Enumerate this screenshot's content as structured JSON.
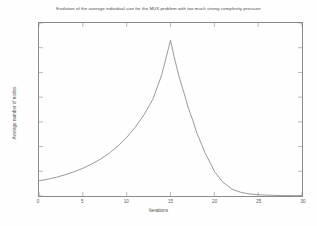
{
  "chart_data": {
    "type": "line",
    "title": "Evolution of the average individual size for the MUX problem with too much strong complexity pressure",
    "xlabel": "Iterations",
    "ylabel": "Average number of nodes",
    "xlim": [
      0,
      30
    ],
    "ylim": [
      0,
      140
    ],
    "xticks": [
      0,
      5,
      10,
      15,
      20,
      25,
      30
    ],
    "yticks": [
      0,
      20,
      40,
      60,
      80,
      100,
      120,
      140
    ],
    "grid": false,
    "legend": null,
    "line_color": "#6e6e6e",
    "series": [
      {
        "name": "average individual size",
        "x": [
          0,
          1,
          2,
          3,
          4,
          5,
          6,
          7,
          8,
          9,
          10,
          11,
          12,
          13,
          14,
          15,
          15.4,
          16,
          16.6,
          17,
          17.6,
          18,
          18.6,
          19,
          19.6,
          20,
          20.6,
          21,
          21.6,
          22,
          22.6,
          23,
          24,
          25,
          26,
          27,
          28,
          29,
          30
        ],
        "y": [
          12.3,
          13.6,
          15.2,
          17.2,
          19.6,
          22.4,
          25.8,
          29.8,
          34.6,
          40.4,
          47.4,
          55.8,
          66.0,
          78.5,
          98.0,
          126.0,
          113.0,
          96.0,
          82.0,
          72.0,
          60.0,
          51.0,
          41.0,
          34.0,
          26.0,
          20.0,
          14.5,
          11.0,
          7.8,
          5.6,
          4.0,
          3.0,
          1.7,
          1.0,
          0.7,
          0.5,
          0.4,
          0.3,
          0.2
        ]
      }
    ],
    "peak": {
      "x": 15,
      "y": 126
    },
    "start": {
      "x": 0,
      "y": 12.3
    }
  },
  "axes": {
    "x_tick_labels": [
      "0",
      "5",
      "10",
      "15",
      "20",
      "25",
      "30"
    ],
    "y_tick_labels": [
      "0",
      "20",
      "40",
      "60",
      "80",
      "100",
      "120",
      "140"
    ]
  },
  "colors": {
    "background": "#fdfdfd",
    "axis": "#8a8a8a",
    "text": "#4a4a4a",
    "line": "#6e6e6e"
  }
}
